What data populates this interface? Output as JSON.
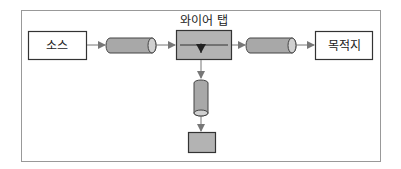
{
  "diagram": {
    "source_label": "소스",
    "wiretap_label": "와이어 탭",
    "destination_label": "목적지",
    "colors": {
      "frame": "#999999",
      "box_fill": "#ffffff",
      "box_stroke": "#333333",
      "node_fill": "#b3b3b3",
      "pipe_fill": "#a8a8a8",
      "arrow": "#777777"
    }
  }
}
